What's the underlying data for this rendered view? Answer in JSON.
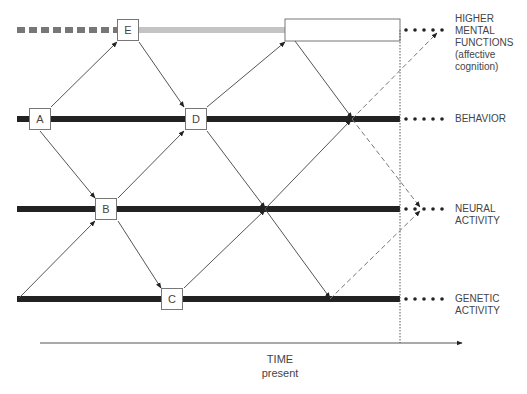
{
  "diagram": {
    "levels": [
      {
        "id": "higher",
        "label_lines": [
          "HIGHER",
          "MENTAL",
          "FUNCTIONS",
          "(affective",
          "cognition)"
        ]
      },
      {
        "id": "behavior",
        "label_lines": [
          "BEHAVIOR"
        ]
      },
      {
        "id": "neural",
        "label_lines": [
          "NEURAL",
          "ACTIVITY"
        ]
      },
      {
        "id": "genetic",
        "label_lines": [
          "GENETIC",
          "ACTIVITY"
        ]
      }
    ],
    "nodes": [
      {
        "id": "A",
        "label": "A",
        "level": "behavior"
      },
      {
        "id": "B",
        "label": "B",
        "level": "neural"
      },
      {
        "id": "C",
        "label": "C",
        "level": "genetic"
      },
      {
        "id": "D",
        "label": "D",
        "level": "behavior"
      },
      {
        "id": "E",
        "label": "E",
        "level": "higher"
      }
    ],
    "edges": [
      [
        "A",
        "E"
      ],
      [
        "A",
        "B"
      ],
      [
        "E",
        "D"
      ],
      [
        "B",
        "D"
      ],
      [
        "B",
        "C"
      ],
      [
        "genetic-start",
        "B"
      ],
      [
        "D",
        "higher-box"
      ],
      [
        "C",
        "neural-crossing"
      ],
      [
        "D",
        "neural-crossing"
      ],
      [
        "neural-crossing",
        "genetic-crossing"
      ],
      [
        "higher-box",
        "behavior-crossing"
      ]
    ],
    "dashed_edges": [
      [
        "behavior-crossing",
        "neural-present"
      ],
      [
        "genetic-crossing",
        "neural-present"
      ],
      [
        "behavior-crossing",
        "higher-present"
      ]
    ],
    "axis": {
      "label": "TIME",
      "marker": "present"
    },
    "caption": ""
  }
}
